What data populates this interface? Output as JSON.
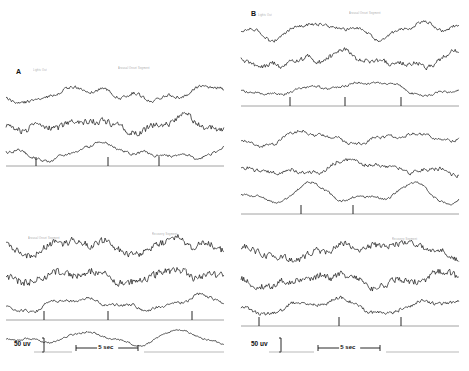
{
  "figure": {
    "background": "#ffffff",
    "trace_color": "#111111",
    "event_line_color": "#8c8c8c",
    "calibration_color": "#111111",
    "annotation_color": "#9a9a9a"
  },
  "panels": [
    {
      "id": "A",
      "label": "A",
      "label_x": 16,
      "label_y": 68,
      "column_x": 6,
      "width": 218,
      "annotations": [
        {
          "text": "Lights Out",
          "x": 33,
          "y": 69
        },
        {
          "text": "Arousal Onset Segment",
          "x": 118,
          "y": 67
        },
        {
          "text": "Arousal Onset Segment",
          "x": 28,
          "y": 237
        },
        {
          "text": "Recovery Segment",
          "x": 152,
          "y": 233
        }
      ],
      "blocks": [
        {
          "name": "block-a1",
          "y": 78,
          "height": 90,
          "traces": [
            {
              "name": "eeg-trace",
              "y": 16,
              "amplitude": 5.5,
              "noise": 2.4,
              "drift": 7,
              "seed": 11
            },
            {
              "name": "eog-trace",
              "y": 47,
              "amplitude": 4.5,
              "noise": 4.6,
              "drift": 5,
              "seed": 23
            },
            {
              "name": "emg-trace",
              "y": 74,
              "amplitude": 4.0,
              "noise": 1.9,
              "drift": 6,
              "seed": 37
            }
          ],
          "event_line": {
            "y": 88,
            "ticks": [
              30,
              102,
              153
            ]
          }
        },
        {
          "name": "block-a2",
          "y": 232,
          "height": 90,
          "traces": [
            {
              "name": "eeg-trace",
              "y": 14,
              "amplitude": 5.0,
              "noise": 5.2,
              "drift": 6,
              "seed": 53
            },
            {
              "name": "eog-trace",
              "y": 44,
              "amplitude": 5.0,
              "noise": 5.8,
              "drift": 5,
              "seed": 67
            },
            {
              "name": "emg-trace",
              "y": 72,
              "amplitude": 4.2,
              "noise": 2.0,
              "drift": 7,
              "seed": 79
            }
          ],
          "event_line": {
            "y": 88,
            "ticks": [
              38,
              102,
              186
            ]
          }
        },
        {
          "name": "block-a3",
          "y": 330,
          "height": 28,
          "traces": [
            {
              "name": "resp-trace",
              "y": 8,
              "amplitude": 3.2,
              "noise": 1.2,
              "drift": 5,
              "seed": 97
            }
          ],
          "event_line": null
        }
      ],
      "calibration": {
        "uv_label": "50 uv",
        "sec_label": "5 sec",
        "uv_x": 14,
        "uv_y": 340,
        "sec_x": 76,
        "sec_y": 344,
        "uv_bar_height": 14,
        "sec_bar_width": 62
      }
    },
    {
      "id": "B",
      "label": "B",
      "label_x": 251,
      "label_y": 10,
      "column_x": 241,
      "width": 218,
      "annotations": [
        {
          "text": "Lights Out",
          "x": 258,
          "y": 14
        },
        {
          "text": "Arousal Onset Segment",
          "x": 349,
          "y": 12
        },
        {
          "text": "Recovery Segment",
          "x": 392,
          "y": 238
        }
      ],
      "blocks": [
        {
          "name": "block-b1",
          "y": 16,
          "height": 92,
          "traces": [
            {
              "name": "eeg-trace",
              "y": 14,
              "amplitude": 5.0,
              "noise": 2.3,
              "drift": 6,
              "seed": 103
            },
            {
              "name": "eog-trace",
              "y": 44,
              "amplitude": 5.5,
              "noise": 3.4,
              "drift": 5,
              "seed": 113
            },
            {
              "name": "emg-trace",
              "y": 72,
              "amplitude": 3.2,
              "noise": 1.6,
              "drift": 5,
              "seed": 127
            }
          ],
          "event_line": {
            "y": 90,
            "ticks": [
              49,
              104,
              160
            ]
          }
        },
        {
          "name": "block-b2",
          "y": 124,
          "height": 92,
          "traces": [
            {
              "name": "eeg-trace",
              "y": 14,
              "amplitude": 4.4,
              "noise": 2.0,
              "drift": 6,
              "seed": 139
            },
            {
              "name": "eog-trace",
              "y": 44,
              "amplitude": 4.8,
              "noise": 2.8,
              "drift": 5,
              "seed": 149
            },
            {
              "name": "emg-trace",
              "y": 70,
              "amplitude": 4.0,
              "noise": 1.6,
              "drift": 7,
              "seed": 163
            }
          ],
          "event_line": {
            "y": 90,
            "ticks": [
              60,
              112
            ]
          }
        },
        {
          "name": "block-b3",
          "y": 236,
          "height": 92,
          "traces": [
            {
              "name": "eeg-trace",
              "y": 14,
              "amplitude": 4.6,
              "noise": 4.4,
              "drift": 6,
              "seed": 173
            },
            {
              "name": "eog-trace",
              "y": 44,
              "amplitude": 4.8,
              "noise": 5.0,
              "drift": 5,
              "seed": 181
            },
            {
              "name": "emg-trace",
              "y": 70,
              "amplitude": 3.6,
              "noise": 2.4,
              "drift": 6,
              "seed": 191
            }
          ],
          "event_line": {
            "y": 90,
            "ticks": [
              18,
              98,
              160
            ]
          }
        }
      ],
      "calibration": {
        "uv_label": "50 uv",
        "sec_label": "5 sec",
        "uv_x": 251,
        "uv_y": 340,
        "sec_x": 318,
        "sec_y": 344,
        "uv_bar_height": 14,
        "sec_bar_width": 62
      }
    }
  ],
  "chart_data": {
    "type": "line",
    "xlabel": "Time",
    "ylabel": "Amplitude (uV)",
    "x_calibration": "5 sec",
    "y_calibration": "50 uv",
    "grid": false,
    "legend": "none",
    "channels_per_block": 3,
    "series": [
      {
        "name": "A1-eeg",
        "panel": "A",
        "block": 1
      },
      {
        "name": "A1-eog",
        "panel": "A",
        "block": 1
      },
      {
        "name": "A1-emg",
        "panel": "A",
        "block": 1
      },
      {
        "name": "A2-eeg",
        "panel": "A",
        "block": 2
      },
      {
        "name": "A2-eog",
        "panel": "A",
        "block": 2
      },
      {
        "name": "A2-emg",
        "panel": "A",
        "block": 2
      },
      {
        "name": "A3-resp",
        "panel": "A",
        "block": 3
      },
      {
        "name": "B1-eeg",
        "panel": "B",
        "block": 1
      },
      {
        "name": "B1-eog",
        "panel": "B",
        "block": 1
      },
      {
        "name": "B1-emg",
        "panel": "B",
        "block": 1
      },
      {
        "name": "B2-eeg",
        "panel": "B",
        "block": 2
      },
      {
        "name": "B2-eog",
        "panel": "B",
        "block": 2
      },
      {
        "name": "B2-emg",
        "panel": "B",
        "block": 2
      },
      {
        "name": "B3-eeg",
        "panel": "B",
        "block": 3
      },
      {
        "name": "B3-eog",
        "panel": "B",
        "block": 3
      },
      {
        "name": "B3-emg",
        "panel": "B",
        "block": 3
      }
    ]
  }
}
